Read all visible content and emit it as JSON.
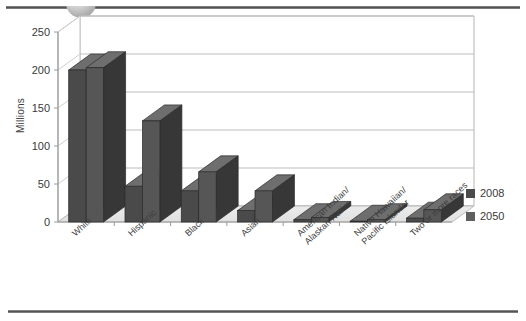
{
  "decor": {
    "header_rule": "header-rule",
    "header_sphere": "sphere-decoration",
    "footer_rule": "footer-rule"
  },
  "chart_data": {
    "type": "bar",
    "title": "",
    "subtitle": "",
    "xlabel": "",
    "ylabel": "Millions",
    "ylim": [
      0,
      250
    ],
    "yticks": [
      0,
      50,
      100,
      150,
      200,
      250
    ],
    "grid": true,
    "grid_axis": "y",
    "three_d": true,
    "legend_position": "right",
    "categories": [
      "White",
      "Hispanic",
      "Black",
      "Asian",
      "American Indian/\nAlaskan Native",
      "Native Hawaiian/\nPacific Islander",
      "Two or more races"
    ],
    "category_lines": [
      [
        "White"
      ],
      [
        "Hispanic"
      ],
      [
        "Black"
      ],
      [
        "Asian"
      ],
      [
        "American Indian/",
        "Alaskan Native"
      ],
      [
        "Native Hawaiian/",
        "Pacific Islander"
      ],
      [
        "Two or more races"
      ]
    ],
    "series": [
      {
        "name": "2008",
        "color": "#4a4a4a",
        "values": [
          200,
          47,
          41,
          15,
          3,
          1,
          5
        ]
      },
      {
        "name": "2050",
        "color": "#5a5a5a",
        "values": [
          203,
          133,
          66,
          41,
          6,
          3,
          16
        ]
      }
    ]
  },
  "legend": {
    "items": [
      {
        "label": "2008",
        "color": "#4a4a4a"
      },
      {
        "label": "2050",
        "color": "#5f5f5f"
      }
    ]
  },
  "axis": {
    "y_title": "Millions",
    "y_tick_labels": [
      "250",
      "200",
      "150",
      "100",
      "50",
      "0"
    ]
  },
  "colors": {
    "bar_front_2008": "#4a4a4a",
    "bar_front_2050": "#565656",
    "bar_top": "#6e6e6e",
    "bar_side": "#373737",
    "floor": "#e8e8e8",
    "wall": "#ffffff",
    "gridline": "#bdbdbd",
    "axis_line": "#9a9a9a",
    "text": "#3a3a3a"
  }
}
